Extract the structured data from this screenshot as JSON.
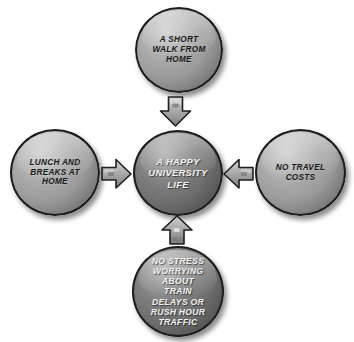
{
  "diagram": {
    "center": {
      "id": "center",
      "label": "A HAPPY\nUNIVERSITY\nLIFE",
      "text_color": "#f2f2f2",
      "fill_color": "#767676"
    },
    "nodes": [
      {
        "id": "top",
        "label": "A SHORT\nWALK FROM\nHOME",
        "position": "top",
        "text_color": "#171717",
        "fill_color": "#a3a3a3"
      },
      {
        "id": "left",
        "label": "LUNCH AND\nBREAKS AT\nHOME",
        "position": "left",
        "text_color": "#171717",
        "fill_color": "#a3a3a3"
      },
      {
        "id": "right",
        "label": "NO TRAVEL\nCOSTS",
        "position": "right",
        "text_color": "#171717",
        "fill_color": "#a3a3a3"
      },
      {
        "id": "bottom",
        "label": "NO STRESS\nWORRYING\nABOUT\nTRAIN\nDELAYS OR\nRUSH HOUR\nTRAFFIC",
        "position": "bottom",
        "text_color": "#f2f2f2",
        "fill_color": "#767676"
      }
    ],
    "arrows": [
      {
        "id": "top",
        "icon": "arrow-down-icon",
        "direction": "down",
        "from": "top",
        "to": "center"
      },
      {
        "id": "left",
        "icon": "arrow-right-icon",
        "direction": "right",
        "from": "left",
        "to": "center"
      },
      {
        "id": "right",
        "icon": "arrow-left-icon",
        "direction": "left",
        "from": "right",
        "to": "center"
      },
      {
        "id": "bottom",
        "icon": "arrow-up-icon",
        "direction": "up",
        "from": "bottom",
        "to": "center"
      }
    ],
    "background_color": "#ffffff",
    "arrow_color": "#9a9a9a",
    "outline_color": "#1c1c1c"
  }
}
